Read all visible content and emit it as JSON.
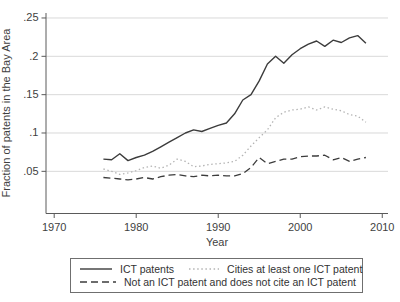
{
  "chart_data": {
    "type": "line",
    "title": "",
    "xlabel": "Year",
    "ylabel": "Fraction of patents in the Bay Area",
    "grid": "horizontal",
    "legend_position": "bottom-boxed",
    "xlim": [
      1969,
      2010.7
    ],
    "ylim": [
      -0.005,
      0.2565
    ],
    "x_ticks": [
      1970,
      1980,
      1990,
      2000,
      2010
    ],
    "y_ticks": [
      {
        "label": ".05",
        "value": 0.05
      },
      {
        "label": ".1",
        "value": 0.1
      },
      {
        "label": ".15",
        "value": 0.15
      },
      {
        "label": ".2",
        "value": 0.2
      },
      {
        "label": ".25",
        "value": 0.25
      }
    ],
    "x": [
      1976,
      1977,
      1978,
      1979,
      1980,
      1981,
      1982,
      1983,
      1984,
      1985,
      1986,
      1987,
      1988,
      1989,
      1990,
      1991,
      1992,
      1993,
      1994,
      1995,
      1996,
      1997,
      1998,
      1999,
      2000,
      2001,
      2002,
      2003,
      2004,
      2005,
      2006,
      2007,
      2008
    ],
    "series": [
      {
        "id": "ict-patents",
        "name": "ICT patents",
        "style": "solid",
        "color": "#3c3c3c",
        "values": [
          0.066,
          0.065,
          0.073,
          0.064,
          0.068,
          0.071,
          0.076,
          0.082,
          0.088,
          0.094,
          0.1,
          0.104,
          0.102,
          0.106,
          0.11,
          0.113,
          0.125,
          0.143,
          0.15,
          0.168,
          0.19,
          0.2,
          0.191,
          0.202,
          0.21,
          0.216,
          0.22,
          0.213,
          0.221,
          0.218,
          0.224,
          0.227,
          0.217
        ]
      },
      {
        "id": "cites-ict-patent",
        "name": "Cities at least one ICT patent",
        "style": "dotted",
        "color": "#b4b4b4",
        "values": [
          0.053,
          0.05,
          0.046,
          0.048,
          0.051,
          0.055,
          0.057,
          0.054,
          0.058,
          0.066,
          0.063,
          0.056,
          0.057,
          0.059,
          0.06,
          0.061,
          0.063,
          0.071,
          0.083,
          0.094,
          0.104,
          0.12,
          0.127,
          0.13,
          0.131,
          0.134,
          0.13,
          0.134,
          0.131,
          0.129,
          0.124,
          0.122,
          0.114
        ]
      },
      {
        "id": "not-ict-no-cite",
        "name": "Not an ICT patent and does not cite an ICT patent",
        "style": "dashed",
        "color": "#3c3c3c",
        "values": [
          0.042,
          0.041,
          0.04,
          0.039,
          0.04,
          0.042,
          0.04,
          0.043,
          0.045,
          0.046,
          0.044,
          0.043,
          0.045,
          0.044,
          0.045,
          0.044,
          0.044,
          0.047,
          0.055,
          0.068,
          0.06,
          0.063,
          0.066,
          0.066,
          0.069,
          0.07,
          0.07,
          0.071,
          0.065,
          0.068,
          0.063,
          0.066,
          0.068
        ]
      }
    ]
  }
}
